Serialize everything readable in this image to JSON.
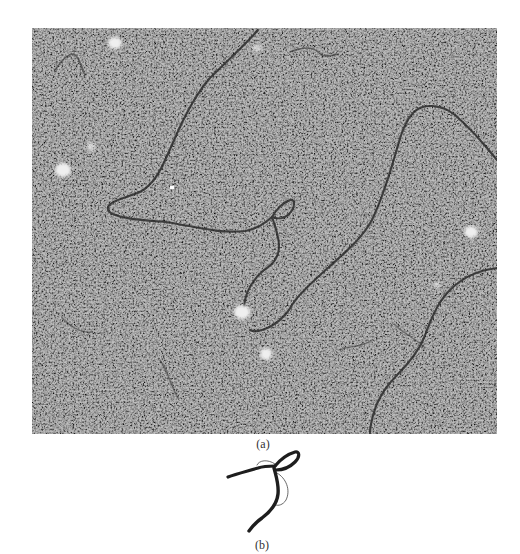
{
  "figure": {
    "panel_a": {
      "label": "(a)",
      "kind": "electron-micrograph",
      "description": "Electron micrograph of DNA molecules on granular stained background, showing a crossover loop",
      "colors": {
        "background": "#9a9a9a",
        "strand": "#2a2a2a",
        "blob": "#efefef"
      }
    },
    "panel_b": {
      "label": "(b)",
      "kind": "schematic-drawing",
      "description": "Line drawing tracing the strand crossover with loop",
      "colors": {
        "strand": "#1e1e1e",
        "outline": "#444444"
      }
    }
  }
}
